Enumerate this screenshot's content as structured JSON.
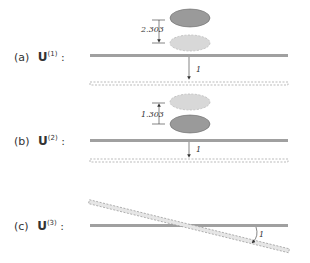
{
  "panels": [
    {
      "letter": "(a)",
      "symbol": "U",
      "superscript": "(1)",
      "colon": ":",
      "offset_label": "2.303",
      "displacement_label": "1",
      "ellipse_motion": "down"
    },
    {
      "letter": "(b)",
      "symbol": "U",
      "superscript": "(2)",
      "colon": ":",
      "offset_label": "1.303",
      "displacement_label": "1",
      "ellipse_motion": "up"
    },
    {
      "letter": "(c)",
      "symbol": "U",
      "superscript": "(3)",
      "colon": ":",
      "displacement_label": "1",
      "motion": "rotation"
    }
  ],
  "colors": {
    "bar": "#a0a0a0",
    "ellipse_solid": "#9a9a9a",
    "ellipse_dashed": "#d8d8d8",
    "text": "#333333"
  }
}
